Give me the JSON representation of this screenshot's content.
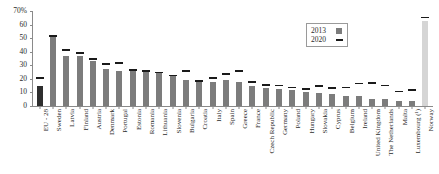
{
  "chart_data": {
    "type": "bar",
    "title": "",
    "subtitle": "",
    "xlabel": "",
    "ylabel": "",
    "ylim": [
      0,
      70
    ],
    "y_unit": "%",
    "grid": false,
    "legend_position": "top-right",
    "y_ticks": [
      {
        "value": 70,
        "label": "70%"
      },
      {
        "value": 60,
        "label": "60"
      },
      {
        "value": 50,
        "label": "50"
      },
      {
        "value": 40,
        "label": "40"
      },
      {
        "value": 30,
        "label": "30"
      },
      {
        "value": 20,
        "label": "20"
      },
      {
        "value": 10,
        "label": "10"
      },
      {
        "value": 0,
        "label": "0"
      }
    ],
    "categories": [
      "EU - 28",
      "Sweden",
      "Latvia",
      "Finland",
      "Austria",
      "Denmark",
      "Portugal",
      "Estonia",
      "Romania",
      "Lithuania",
      "Slovenia",
      "Bulgaria",
      "Croatia",
      "Italy",
      "Spain",
      "Greece",
      "France",
      "Czech Republic",
      "Germany",
      "Poland",
      "Hungary",
      "Slovakia",
      "Cyprus",
      "Belgium",
      "Ireland",
      "United Kingdom",
      "The Netherlands",
      "Malta",
      "Luxembourg (¹)",
      "Norway"
    ],
    "series": [
      {
        "name": "2013",
        "type": "bar",
        "values": [
          15,
          50.5,
          36.5,
          37,
          33,
          27,
          26,
          26,
          25,
          24,
          22,
          19,
          18,
          18,
          19.5,
          18,
          14.5,
          13.5,
          12.5,
          11.5,
          10,
          9.5,
          8.5,
          7.5,
          7.5,
          5.5,
          5,
          3.5,
          4,
          63
        ]
      },
      {
        "name": "2020",
        "type": "marker",
        "values": [
          20,
          51,
          40.5,
          38.5,
          34,
          30.5,
          31,
          26,
          25,
          24,
          22,
          25,
          18,
          20,
          23,
          25,
          17,
          15,
          14.5,
          13,
          12,
          14,
          12.5,
          13,
          16,
          16.5,
          14.5,
          10,
          11,
          64.5
        ]
      }
    ],
    "bar_style": {
      "default_color": "#7c7c7c",
      "eu_aggregate_color": "#2e2e2e",
      "non_member_color": "#d5d5d5",
      "marker_color": "#1a1a1a",
      "eu_aggregate_index": 0,
      "non_member_index": 29
    }
  },
  "legend": {
    "items": [
      {
        "label": "2013",
        "swatch": "filled-square"
      },
      {
        "label": "2020",
        "swatch": "dash"
      }
    ]
  }
}
